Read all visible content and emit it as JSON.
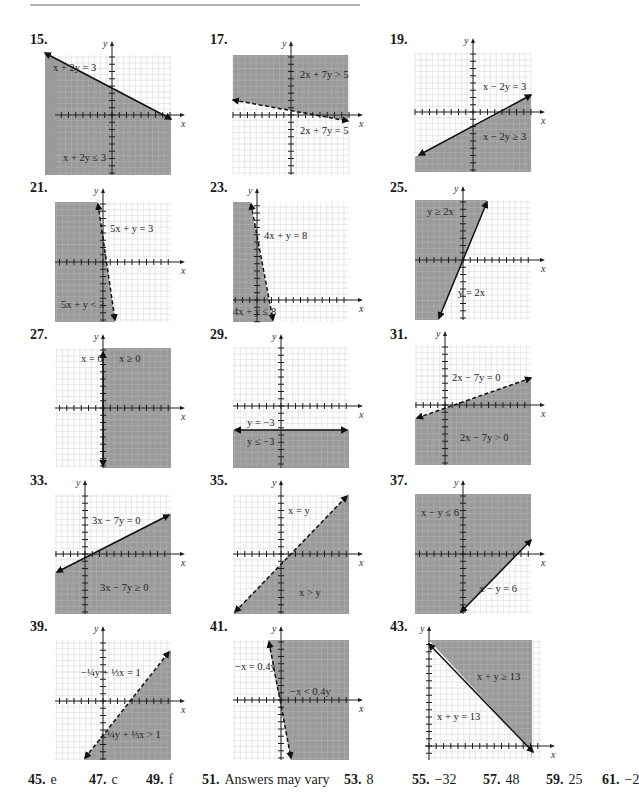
{
  "style": {
    "shade_color": "#9a9a9a",
    "grid_color": "#d4d4d4",
    "axis_color": "#1e1e1e",
    "line_color": "#111111"
  },
  "problems": [
    {
      "num": "15.",
      "numPos": [
        30,
        42
      ],
      "box": [
        55,
        55
      ],
      "axis": {
        "x": 57,
        "y": 60
      },
      "line": {
        "from": [
          -10,
          -2
        ],
        "to": [
          116,
          64
        ],
        "dashed": false,
        "arrows": true
      },
      "shade": [
        [
          -10,
          -2
        ],
        [
          116,
          64
        ],
        [
          116,
          120
        ],
        [
          -10,
          120
        ]
      ],
      "labels": [
        {
          "text": "x + 2y = 3",
          "pos": [
            -2,
            16
          ]
        },
        {
          "text": "x + 2y ≤ 3",
          "pos": [
            8,
            106
          ]
        }
      ]
    },
    {
      "num": "17.",
      "numPos": [
        210,
        42
      ],
      "box": [
        233,
        55
      ],
      "axis": {
        "x": 58,
        "y": 60
      },
      "line": {
        "from": [
          0,
          45
        ],
        "to": [
          115,
          66
        ],
        "dashed": true,
        "arrows": true
      },
      "shade": [
        [
          0,
          0
        ],
        [
          115,
          0
        ],
        [
          115,
          66
        ],
        [
          0,
          45
        ]
      ],
      "labels": [
        {
          "text": "2x + 7y > 5",
          "pos": [
            67,
            23
          ]
        },
        {
          "text": "2x + 7y = 5",
          "pos": [
            67,
            79
          ]
        }
      ]
    },
    {
      "num": "19.",
      "numPos": [
        390,
        42
      ],
      "box": [
        415,
        52
      ],
      "axis": {
        "x": 58,
        "y": 60
      },
      "line": {
        "from": [
          4,
          103
        ],
        "to": [
          116,
          43
        ],
        "dashed": false,
        "arrows": true
      },
      "shade": [
        [
          0,
          105
        ],
        [
          116,
          43
        ],
        [
          116,
          120
        ],
        [
          0,
          120
        ]
      ],
      "labels": [
        {
          "text": "x − 2y = 3",
          "pos": [
            68,
            38
          ]
        },
        {
          "text": "x − 2y ≥ 3",
          "pos": [
            68,
            88
          ]
        }
      ]
    },
    {
      "num": "21.",
      "numPos": [
        30,
        190
      ],
      "box": [
        55,
        202
      ],
      "axis": {
        "x": 48,
        "y": 60
      },
      "line": {
        "from": [
          43,
          2
        ],
        "to": [
          60,
          118
        ],
        "dashed": true,
        "arrows": true
      },
      "shade": [
        [
          0,
          0
        ],
        [
          43,
          0
        ],
        [
          60,
          120
        ],
        [
          0,
          120
        ]
      ],
      "labels": [
        {
          "text": "5x + y = 3",
          "pos": [
            55,
            30
          ]
        },
        {
          "text": "5x + y < 3",
          "pos": [
            6,
            106
          ]
        }
      ]
    },
    {
      "num": "23.",
      "numPos": [
        210,
        190
      ],
      "box": [
        233,
        202
      ],
      "axis": {
        "x": 24,
        "y": 98
      },
      "line": {
        "from": [
          18,
          2
        ],
        "to": [
          40,
          118
        ],
        "dashed": true,
        "arrows": true
      },
      "shade": [
        [
          0,
          0
        ],
        [
          17,
          0
        ],
        [
          40,
          120
        ],
        [
          0,
          120
        ]
      ],
      "labels": [
        {
          "text": "4x + y = 8",
          "pos": [
            31,
            37
          ]
        },
        {
          "text": "4x + y ≤ 8",
          "pos": [
            0,
            113
          ]
        }
      ]
    },
    {
      "num": "25.",
      "numPos": [
        390,
        190
      ],
      "box": [
        415,
        200
      ],
      "axis": {
        "x": 48,
        "y": 60
      },
      "line": {
        "from": [
          24,
          118
        ],
        "to": [
          72,
          2
        ],
        "dashed": false,
        "arrows": true
      },
      "shade": [
        [
          0,
          0
        ],
        [
          72,
          0
        ],
        [
          24,
          120
        ],
        [
          0,
          120
        ]
      ],
      "labels": [
        {
          "text": "y ≥ 2x",
          "pos": [
            12,
            15
          ]
        },
        {
          "text": "y = 2x",
          "pos": [
            43,
            96
          ]
        }
      ]
    },
    {
      "num": "27.",
      "numPos": [
        30,
        337
      ],
      "box": [
        55,
        348
      ],
      "axis": {
        "x": 48,
        "y": 60
      },
      "line": {
        "from": [
          48,
          4
        ],
        "to": [
          48,
          118
        ],
        "dashed": false,
        "arrows": true
      },
      "shade": [
        [
          48,
          0
        ],
        [
          116,
          0
        ],
        [
          116,
          120
        ],
        [
          48,
          120
        ]
      ],
      "labels": [
        {
          "text": "x = 0",
          "pos": [
            26,
            14
          ]
        },
        {
          "text": "x ≥ 0",
          "pos": [
            64,
            14
          ]
        }
      ]
    },
    {
      "num": "29.",
      "numPos": [
        210,
        337
      ],
      "box": [
        233,
        348
      ],
      "axis": {
        "x": 48,
        "y": 58
      },
      "line": {
        "from": [
          2,
          82
        ],
        "to": [
          114,
          82
        ],
        "dashed": false,
        "arrows": true
      },
      "shade": [
        [
          0,
          82
        ],
        [
          116,
          82
        ],
        [
          116,
          120
        ],
        [
          0,
          120
        ]
      ],
      "labels": [
        {
          "text": "y = −3",
          "pos": [
            14,
            78
          ]
        },
        {
          "text": "y ≤ −3",
          "pos": [
            14,
            97
          ]
        }
      ]
    },
    {
      "num": "31.",
      "numPos": [
        390,
        337
      ],
      "box": [
        415,
        345
      ],
      "axis": {
        "x": 30,
        "y": 60
      },
      "line": {
        "from": [
          2,
          73
        ],
        "to": [
          116,
          33
        ],
        "dashed": true,
        "arrows": true
      },
      "shade": [
        [
          0,
          74
        ],
        [
          116,
          33
        ],
        [
          116,
          120
        ],
        [
          0,
          120
        ]
      ],
      "labels": [
        {
          "text": "2x − 7y = 0",
          "pos": [
            37,
            36
          ]
        },
        {
          "text": "2x − 7y > 0",
          "pos": [
            45,
            96
          ]
        }
      ]
    },
    {
      "num": "33.",
      "numPos": [
        30,
        483
      ],
      "box": [
        55,
        494
      ],
      "axis": {
        "x": 30,
        "y": 60
      },
      "line": {
        "from": [
          2,
          78
        ],
        "to": [
          114,
          21
        ],
        "dashed": false,
        "arrows": true
      },
      "shade": [
        [
          0,
          79
        ],
        [
          116,
          20
        ],
        [
          116,
          120
        ],
        [
          0,
          120
        ]
      ],
      "labels": [
        {
          "text": "3x − 7y = 0",
          "pos": [
            37,
            30
          ]
        },
        {
          "text": "3x − 7y ≥ 0",
          "pos": [
            45,
            97
          ]
        }
      ]
    },
    {
      "num": "35.",
      "numPos": [
        210,
        483
      ],
      "box": [
        233,
        494
      ],
      "axis": {
        "x": 48,
        "y": 60
      },
      "line": {
        "from": [
          2,
          118
        ],
        "to": [
          114,
          2
        ],
        "dashed": true,
        "arrows": true
      },
      "shade": [
        [
          116,
          0
        ],
        [
          116,
          120
        ],
        [
          0,
          120
        ]
      ],
      "labels": [
        {
          "text": "x = y",
          "pos": [
            55,
            20
          ]
        },
        {
          "text": "x > y",
          "pos": [
            66,
            102
          ]
        }
      ]
    },
    {
      "num": "37.",
      "numPos": [
        390,
        483
      ],
      "box": [
        415,
        494
      ],
      "axis": {
        "x": 48,
        "y": 60
      },
      "line": {
        "from": [
          46,
          118
        ],
        "to": [
          116,
          46
        ],
        "dashed": false,
        "arrows": true
      },
      "shade": [
        [
          0,
          0
        ],
        [
          116,
          0
        ],
        [
          116,
          45
        ],
        [
          45,
          120
        ],
        [
          0,
          120
        ]
      ],
      "labels": [
        {
          "text": "x − y ≤ 6",
          "pos": [
            6,
            22
          ]
        },
        {
          "text": "x − y = 6",
          "pos": [
            64,
            98
          ]
        }
      ]
    },
    {
      "num": "39.",
      "numPos": [
        30,
        629
      ],
      "box": [
        55,
        640
      ],
      "axis": {
        "x": 48,
        "y": 61
      },
      "line": {
        "from": [
          30,
          118
        ],
        "to": [
          114,
          12
        ],
        "dashed": true,
        "arrows": true
      },
      "shade": [
        [
          116,
          10
        ],
        [
          116,
          120
        ],
        [
          29,
          120
        ]
      ],
      "labels": [
        {
          "text": "−¼y + ⅓x = 1",
          "pos": [
            26,
            36
          ]
        },
        {
          "text": "−¼y + ⅓x > 1",
          "pos": [
            46,
            98
          ]
        }
      ]
    },
    {
      "num": "41.",
      "numPos": [
        210,
        629
      ],
      "box": [
        233,
        640
      ],
      "axis": {
        "x": 48,
        "y": 60
      },
      "line": {
        "from": [
          36,
          2
        ],
        "to": [
          58,
          118
        ],
        "dashed": true,
        "arrows": true
      },
      "shade": [
        [
          35,
          0
        ],
        [
          116,
          0
        ],
        [
          116,
          120
        ],
        [
          58,
          120
        ]
      ],
      "labels": [
        {
          "text": "−x = 0.4y",
          "pos": [
            2,
            30
          ]
        },
        {
          "text": "−x < 0.4y",
          "pos": [
            57,
            55
          ]
        }
      ]
    },
    {
      "num": "43.",
      "numPos": [
        390,
        629
      ],
      "box": [
        425,
        640
      ],
      "axis": {
        "x": 4,
        "y": 106
      },
      "line": {
        "from": [
          4,
          4
        ],
        "to": [
          108,
          112
        ],
        "dashed": false,
        "arrows": true
      },
      "shade": [
        [
          4,
          0
        ],
        [
          107,
          0
        ],
        [
          107,
          120
        ],
        [
          106,
          110
        ]
      ],
      "labels": [
        {
          "text": "x + y ≥ 13",
          "pos": [
            52,
            40
          ]
        },
        {
          "text": "x + y = 13",
          "pos": [
            12,
            80
          ]
        }
      ]
    }
  ],
  "axis_labels": {
    "x": "x",
    "y": "y"
  },
  "footer": [
    {
      "num": "45.",
      "val": "e",
      "left": 0
    },
    {
      "num": "47.",
      "val": "c",
      "left": 61
    },
    {
      "num": "49.",
      "val": "f",
      "left": 118
    },
    {
      "num": "51.",
      "val": "Answers may vary",
      "left": 174
    },
    {
      "num": "53.",
      "val": "8",
      "left": 316
    },
    {
      "num": "55.",
      "val": "−32",
      "left": 384
    },
    {
      "num": "57.",
      "val": "48",
      "left": 455
    },
    {
      "num": "59.",
      "val": "25",
      "left": 518
    },
    {
      "num": "61.",
      "val": "−2",
      "left": 574
    }
  ]
}
